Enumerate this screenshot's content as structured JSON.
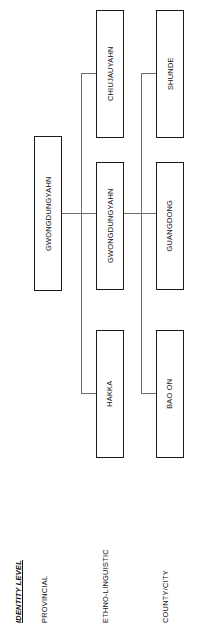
{
  "diagram": {
    "type": "hierarchy-tree",
    "orientation": "rotated-90-ccw",
    "axis_title": "IDENTITY LEVEL",
    "levels": [
      {
        "id": "provincial",
        "label": "PROVINCIAL"
      },
      {
        "id": "ethno-linguistic",
        "label": "ETHNO-LINGUISTIC"
      },
      {
        "id": "county-city",
        "label": "COUNTY/CITY"
      }
    ],
    "nodes": {
      "provincial_center": "GWONGDUNGYAHN",
      "ethno_top": "CHIUJAUYAHN",
      "ethno_center": "GWONGDUNGYAHN",
      "ethno_bottom": "HAKKA",
      "county_top": "SHUNDE",
      "county_center": "GUANGDONG",
      "county_bottom": "BAO ON"
    },
    "colors": {
      "box_border": "#1b1b1b",
      "box_fill": "#ffffff",
      "connector": "#6e6e6e",
      "text": "#111111",
      "background": "#ffffff"
    }
  }
}
